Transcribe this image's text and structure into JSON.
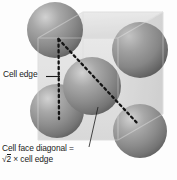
{
  "figure": {
    "kind": "face-centered-cubic-unit-cell-diagram",
    "background_color": "#fdfdfd",
    "cube": {
      "name": "translucent-unit-cell-cube",
      "fill_color": "#dcdcdc",
      "edge_color": "#c4c4c4",
      "opacity": 0.78
    },
    "spheres": {
      "name": "atom-spheres",
      "base_color": "#8a8a8a",
      "highlight_color": "#c9c9c9",
      "shadow_color": "#5a5a5a",
      "count": 5,
      "items": [
        {
          "id": "sphere-top-left",
          "cx": 55,
          "cy": 30,
          "r": 28
        },
        {
          "id": "sphere-top-right",
          "cx": 140,
          "cy": 50,
          "r": 28
        },
        {
          "id": "sphere-center-face",
          "cx": 92,
          "cy": 86,
          "r": 29
        },
        {
          "id": "sphere-bottom-left",
          "cx": 57,
          "cy": 111,
          "r": 27
        },
        {
          "id": "sphere-bottom-right",
          "cx": 140,
          "cy": 131,
          "r": 27
        }
      ]
    },
    "dashed_triangle": {
      "name": "cell-edge-and-face-diagonal-triangle",
      "color": "#111111",
      "apex": {
        "x": 58,
        "y": 39
      },
      "bottom_left": {
        "x": 59,
        "y": 119
      },
      "bottom_right": {
        "x": 138,
        "y": 124
      }
    },
    "labels": {
      "cell_edge": {
        "text": "Cell edge",
        "leader": {
          "from_x": 48,
          "from_y": 77,
          "to_x": 60,
          "to_y": 77
        }
      },
      "face_diagonal": {
        "line1": "Cell face diagonal =",
        "radicand": "2",
        "line2_tail": "× cell edge",
        "leader": {
          "from_x": 90,
          "from_y": 146,
          "to_x": 97,
          "to_y": 108
        }
      }
    }
  }
}
